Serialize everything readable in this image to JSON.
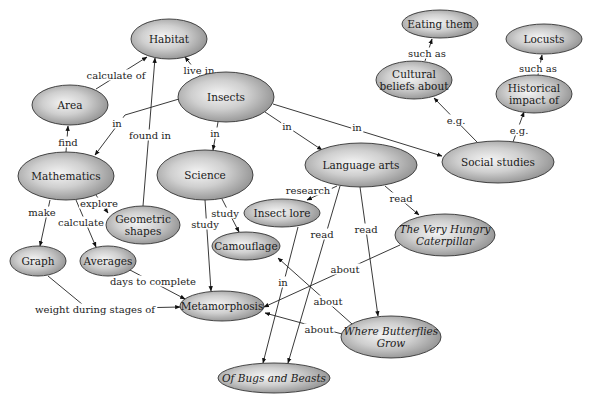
{
  "colors": {
    "node_light": "#f2f2f2",
    "node_dark": "#8a8a8a",
    "stroke": "#333333",
    "text": "#1a1a1a",
    "background": "#ffffff"
  },
  "nodes": [
    {
      "id": "habitat",
      "label": "Habitat",
      "lines": [
        "Habitat"
      ],
      "cx": 169,
      "cy": 39,
      "rx": 38,
      "ry": 20,
      "italic": false
    },
    {
      "id": "insects",
      "label": "Insects",
      "lines": [
        "Insects"
      ],
      "cx": 226,
      "cy": 97,
      "rx": 48,
      "ry": 25,
      "italic": false
    },
    {
      "id": "area",
      "label": "Area",
      "lines": [
        "Area"
      ],
      "cx": 70,
      "cy": 105,
      "rx": 38,
      "ry": 20,
      "italic": false
    },
    {
      "id": "mathematics",
      "label": "Mathematics",
      "lines": [
        "Mathematics"
      ],
      "cx": 66,
      "cy": 176,
      "rx": 48,
      "ry": 24,
      "italic": false
    },
    {
      "id": "science",
      "label": "Science",
      "lines": [
        "Science"
      ],
      "cx": 205,
      "cy": 175,
      "rx": 48,
      "ry": 25,
      "italic": false
    },
    {
      "id": "language_arts",
      "label": "Language arts",
      "lines": [
        "Language arts"
      ],
      "cx": 361,
      "cy": 165,
      "rx": 56,
      "ry": 22,
      "italic": false
    },
    {
      "id": "social_studies",
      "label": "Social studies",
      "lines": [
        "Social studies"
      ],
      "cx": 498,
      "cy": 162,
      "rx": 56,
      "ry": 21,
      "italic": false
    },
    {
      "id": "eating_them",
      "label": "Eating them",
      "lines": [
        "Eating them"
      ],
      "cx": 440,
      "cy": 24,
      "rx": 38,
      "ry": 14,
      "italic": false
    },
    {
      "id": "locusts",
      "label": "Locusts",
      "lines": [
        "Locusts"
      ],
      "cx": 544,
      "cy": 39,
      "rx": 38,
      "ry": 15,
      "italic": false
    },
    {
      "id": "cultural_beliefs",
      "label": "Cultural beliefs about",
      "lines": [
        "Cultural",
        "beliefs about"
      ],
      "cx": 414,
      "cy": 80,
      "rx": 38,
      "ry": 19,
      "italic": false
    },
    {
      "id": "historical_impact",
      "label": "Historical impact of",
      "lines": [
        "Historical",
        "impact of"
      ],
      "cx": 534,
      "cy": 94,
      "rx": 38,
      "ry": 19,
      "italic": false
    },
    {
      "id": "geometric_shapes",
      "label": "Geometric shapes",
      "lines": [
        "Geometric",
        "shapes"
      ],
      "cx": 143,
      "cy": 225,
      "rx": 37,
      "ry": 19,
      "italic": false
    },
    {
      "id": "insect_lore",
      "label": "Insect lore",
      "lines": [
        "Insect lore"
      ],
      "cx": 282,
      "cy": 213,
      "rx": 38,
      "ry": 14,
      "italic": false
    },
    {
      "id": "camouflage",
      "label": "Camouflage",
      "lines": [
        "Camouflage"
      ],
      "cx": 246,
      "cy": 246,
      "rx": 34,
      "ry": 14,
      "italic": false
    },
    {
      "id": "hungry_caterpillar",
      "label": "The Very Hungry Caterpillar",
      "lines": [
        "The Very Hungry",
        "Caterpillar"
      ],
      "cx": 445,
      "cy": 235,
      "rx": 50,
      "ry": 21,
      "italic": true
    },
    {
      "id": "graph",
      "label": "Graph",
      "lines": [
        "Graph"
      ],
      "cx": 38,
      "cy": 261,
      "rx": 28,
      "ry": 15,
      "italic": false
    },
    {
      "id": "averages",
      "label": "Averages",
      "lines": [
        "Averages"
      ],
      "cx": 108,
      "cy": 261,
      "rx": 28,
      "ry": 15,
      "italic": false
    },
    {
      "id": "metamorphosis",
      "label": "Metamorphosis",
      "lines": [
        "Metamorphosis"
      ],
      "cx": 222,
      "cy": 306,
      "rx": 42,
      "ry": 15,
      "italic": false
    },
    {
      "id": "where_butterflies_grow",
      "label": "Where Butterflies Grow",
      "lines": [
        "Where Butterflies",
        "Grow"
      ],
      "cx": 391,
      "cy": 337,
      "rx": 50,
      "ry": 21,
      "italic": true
    },
    {
      "id": "bugs_and_beasts",
      "label": "Of Bugs and Beasts",
      "lines": [
        "Of Bugs and Beasts"
      ],
      "cx": 274,
      "cy": 378,
      "rx": 56,
      "ry": 15,
      "italic": true
    }
  ],
  "edges": [
    {
      "id": "area_habitat",
      "from": "area",
      "to": "habitat",
      "label": "calculate of",
      "points": [
        [
          96,
          89
        ],
        [
          147,
          57
        ]
      ],
      "label_pos": [
        116,
        75
      ]
    },
    {
      "id": "insects_habitat",
      "from": "insects",
      "to": "habitat",
      "label": "live in",
      "points": [
        [
          200,
          76
        ],
        [
          185,
          57
        ]
      ],
      "label_pos": [
        199,
        70
      ]
    },
    {
      "id": "geometric_habitat",
      "from": "geometric_shapes",
      "to": "habitat",
      "label": "found in",
      "points": [
        [
          143,
          206
        ],
        [
          155,
          58
        ]
      ],
      "label_pos": [
        150,
        135
      ]
    },
    {
      "id": "insects_math",
      "from": "insects",
      "to": "mathematics",
      "label": "in",
      "points": [
        [
          179,
          99
        ],
        [
          125,
          115
        ],
        [
          95,
          155
        ]
      ],
      "label_pos": [
        117,
        123
      ]
    },
    {
      "id": "math_area",
      "from": "mathematics",
      "to": "area",
      "label": "find",
      "points": [
        [
          66,
          152
        ],
        [
          68,
          126
        ]
      ],
      "label_pos": [
        68,
        142
      ]
    },
    {
      "id": "insects_science",
      "from": "insects",
      "to": "science",
      "label": "in",
      "points": [
        [
          218,
          122
        ],
        [
          213,
          150
        ]
      ],
      "label_pos": [
        215,
        133
      ]
    },
    {
      "id": "insects_language",
      "from": "insects",
      "to": "language_arts",
      "label": "in",
      "points": [
        [
          265,
          112
        ],
        [
          322,
          150
        ]
      ],
      "label_pos": [
        287,
        126
      ]
    },
    {
      "id": "insects_social",
      "from": "insects",
      "to": "social_studies",
      "label": "in",
      "points": [
        [
          273,
          104
        ],
        [
          442,
          156
        ]
      ],
      "label_pos": [
        357,
        127
      ]
    },
    {
      "id": "social_cultural",
      "from": "social_studies",
      "to": "cultural_beliefs",
      "label": "e.g.",
      "points": [
        [
          477,
          142
        ],
        [
          434,
          98
        ]
      ],
      "label_pos": [
        456,
        120
      ]
    },
    {
      "id": "social_historical",
      "from": "social_studies",
      "to": "historical_impact",
      "label": "e.g.",
      "points": [
        [
          513,
          142
        ],
        [
          524,
          112
        ]
      ],
      "label_pos": [
        519,
        130
      ]
    },
    {
      "id": "cultural_eating",
      "from": "cultural_beliefs",
      "to": "eating_them",
      "label": "such as",
      "points": [
        [
          425,
          61
        ],
        [
          432,
          39
        ]
      ],
      "label_pos": [
        427,
        53
      ]
    },
    {
      "id": "historical_locusts",
      "from": "historical_impact",
      "to": "locusts",
      "label": "such as",
      "points": [
        [
          538,
          75
        ],
        [
          542,
          55
        ]
      ],
      "label_pos": [
        538,
        68
      ]
    },
    {
      "id": "math_geometric",
      "from": "mathematics",
      "to": "geometric_shapes",
      "label": "explore",
      "points": [
        [
          96,
          195
        ],
        [
          108,
          213
        ]
      ],
      "label_pos": [
        99,
        203
      ]
    },
    {
      "id": "math_graph",
      "from": "mathematics",
      "to": "graph",
      "label": "make",
      "points": [
        [
          50,
          200
        ],
        [
          40,
          246
        ]
      ],
      "label_pos": [
        42,
        212
      ]
    },
    {
      "id": "math_averages",
      "from": "mathematics",
      "to": "averages",
      "label": "calculate",
      "points": [
        [
          76,
          200
        ],
        [
          96,
          247
        ]
      ],
      "label_pos": [
        81,
        222
      ]
    },
    {
      "id": "science_camouflage",
      "from": "science",
      "to": "camouflage",
      "label": "study",
      "points": [
        [
          222,
          199
        ],
        [
          239,
          232
        ]
      ],
      "label_pos": [
        225,
        213
      ]
    },
    {
      "id": "science_metamorphosis",
      "from": "science",
      "to": "metamorphosis",
      "label": "study",
      "points": [
        [
          205,
          200
        ],
        [
          211,
          291
        ]
      ],
      "label_pos": [
        205,
        224
      ]
    },
    {
      "id": "language_insect_lore",
      "from": "language_arts",
      "to": "insect_lore",
      "label": "research",
      "points": [
        [
          337,
          186
        ],
        [
          307,
          200
        ]
      ],
      "label_pos": [
        308,
        190
      ]
    },
    {
      "id": "language_caterpillar",
      "from": "language_arts",
      "to": "hungry_caterpillar",
      "label": "read",
      "points": [
        [
          385,
          186
        ],
        [
          419,
          215
        ]
      ],
      "label_pos": [
        401,
        198
      ]
    },
    {
      "id": "language_where_butterflies",
      "from": "language_arts",
      "to": "where_butterflies_grow",
      "label": "read",
      "points": [
        [
          360,
          187
        ],
        [
          378,
          316
        ]
      ],
      "label_pos": [
        366,
        229
      ]
    },
    {
      "id": "language_bugs",
      "from": "language_arts",
      "to": "bugs_and_beasts",
      "label": "read",
      "points": [
        [
          340,
          186
        ],
        [
          288,
          363
        ]
      ],
      "label_pos": [
        322,
        234
      ]
    },
    {
      "id": "insect_lore_bugs",
      "from": "insect_lore",
      "to": "bugs_and_beasts",
      "label": "in",
      "points": [
        [
          298,
          227
        ],
        [
          263,
          363
        ]
      ],
      "label_pos": [
        283,
        282
      ]
    },
    {
      "id": "averages_metamorphosis",
      "from": "averages",
      "to": "metamorphosis",
      "label": "days to complete",
      "points": [
        [
          130,
          270
        ],
        [
          185,
          299
        ]
      ],
      "label_pos": [
        153,
        281
      ]
    },
    {
      "id": "graph_metamorphosis",
      "from": "graph",
      "to": "metamorphosis",
      "label": "weight during stages of",
      "points": [
        [
          48,
          276
        ],
        [
          88,
          309
        ],
        [
          180,
          307
        ]
      ],
      "label_pos": [
        95,
        309
      ]
    },
    {
      "id": "caterpillar_metamorphosis",
      "from": "hungry_caterpillar",
      "to": "metamorphosis",
      "label": "about",
      "points": [
        [
          400,
          245
        ],
        [
          264,
          307
        ]
      ],
      "label_pos": [
        345,
        269
      ]
    },
    {
      "id": "where_camouflage",
      "from": "where_butterflies_grow",
      "to": "camouflage",
      "label": "about",
      "points": [
        [
          352,
          324
        ],
        [
          278,
          258
        ]
      ],
      "label_pos": [
        328,
        301
      ]
    },
    {
      "id": "where_metamorphosis",
      "from": "where_butterflies_grow",
      "to": "metamorphosis",
      "label": "about",
      "points": [
        [
          342,
          334
        ],
        [
          265,
          313
        ]
      ],
      "label_pos": [
        319,
        329
      ]
    }
  ]
}
